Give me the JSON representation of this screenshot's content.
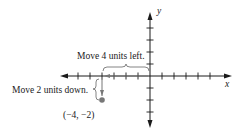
{
  "diagram": {
    "type": "coordinate-plane",
    "axes": {
      "x_label": "x",
      "y_label": "y"
    },
    "annotations": {
      "horizontal_move": "Move 4 units left.",
      "vertical_move": "Move 2 units down.",
      "point_label": "(−4, −2)"
    },
    "point": {
      "x": -4,
      "y": -2
    },
    "colors": {
      "axis": "#1a1a1a",
      "point": "#777777",
      "brace": "#555555"
    }
  }
}
